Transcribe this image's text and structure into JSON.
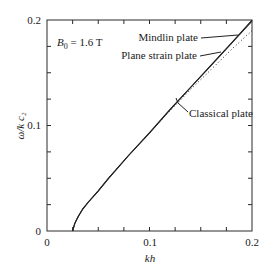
{
  "chart_data": {
    "type": "line",
    "title": "",
    "xlabel": "kh",
    "ylabel": "ω/k c₂",
    "xlim": [
      0,
      0.2
    ],
    "ylim": [
      0,
      0.2
    ],
    "x_ticks": [
      "0",
      "0.1",
      "0.2"
    ],
    "y_ticks": [
      "0",
      "0.1",
      "0.2"
    ],
    "grid": false,
    "annotation": "B₀ = 1.6 T",
    "series": [
      {
        "name": "Mindlin plate",
        "style": "solid",
        "x": [
          0.025,
          0.027,
          0.03,
          0.035,
          0.04,
          0.05,
          0.06,
          0.08,
          0.1,
          0.12,
          0.14,
          0.16,
          0.18,
          0.2
        ],
        "y": [
          0.0,
          0.007,
          0.013,
          0.021,
          0.027,
          0.038,
          0.05,
          0.072,
          0.093,
          0.115,
          0.136,
          0.157,
          0.178,
          0.2
        ]
      },
      {
        "name": "Plane strain plate",
        "style": "solid",
        "x": [
          0.025,
          0.027,
          0.03,
          0.035,
          0.04,
          0.05,
          0.06,
          0.08,
          0.1,
          0.12,
          0.14,
          0.16,
          0.18,
          0.2
        ],
        "y": [
          0.0,
          0.007,
          0.013,
          0.021,
          0.027,
          0.038,
          0.05,
          0.072,
          0.093,
          0.115,
          0.136,
          0.157,
          0.178,
          0.199
        ]
      },
      {
        "name": "Classical plate",
        "style": "dotted",
        "x": [
          0.025,
          0.027,
          0.03,
          0.035,
          0.04,
          0.05,
          0.06,
          0.08,
          0.1,
          0.12,
          0.14,
          0.16,
          0.18,
          0.2
        ],
        "y": [
          0.0,
          0.007,
          0.013,
          0.021,
          0.027,
          0.038,
          0.05,
          0.072,
          0.093,
          0.114,
          0.134,
          0.153,
          0.172,
          0.19
        ]
      }
    ],
    "legend_labels": {
      "mindlin": "Mindlin plate",
      "plane_strain": "Plane strain plate",
      "classical": "Classical plate"
    }
  }
}
